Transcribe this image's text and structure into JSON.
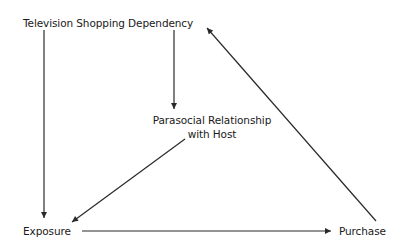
{
  "diagram": {
    "nodes": {
      "tv_dependency": {
        "label": "Television Shopping Dependency"
      },
      "parasocial": {
        "line1": "Parasocial Relationship",
        "line2": "with Host"
      },
      "exposure": {
        "label": "Exposure"
      },
      "purchase": {
        "label": "Purchase"
      }
    },
    "edges": [
      {
        "from": "Television Shopping Dependency",
        "to": "Exposure"
      },
      {
        "from": "Television Shopping Dependency",
        "to": "Parasocial Relationship with Host"
      },
      {
        "from": "Parasocial Relationship with Host",
        "to": "Exposure"
      },
      {
        "from": "Exposure",
        "to": "Purchase"
      },
      {
        "from": "Purchase",
        "to": "Television Shopping Dependency"
      }
    ],
    "colors": {
      "line": "#2a2a2a",
      "text": "#1a1a1a",
      "background": "#ffffff"
    }
  }
}
